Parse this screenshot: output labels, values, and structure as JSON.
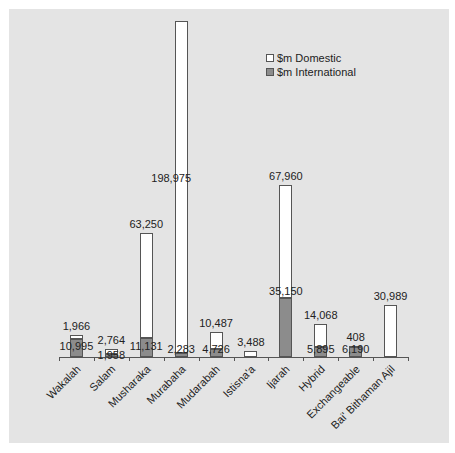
{
  "chart_data": {
    "type": "bar",
    "stacked": true,
    "title": "",
    "xlabel": "",
    "ylabel": "",
    "grid": false,
    "legend_position": "upper right",
    "categories": [
      "Wakalah",
      "Salam",
      "Musharaka",
      "Murabaha",
      "Mudarabah",
      "Istisna'a",
      "Ijarah",
      "Hybrid",
      "Exchangeable",
      "Bai' Bithaman Ajil"
    ],
    "series": [
      {
        "name": "$m International",
        "color": "#8c8c8c",
        "values": [
          10995,
          1958,
          11131,
          2283,
          4726,
          0,
          35150,
          5895,
          6190,
          0
        ]
      },
      {
        "name": "$m Domestic",
        "color": "#ffffff",
        "values": [
          1966,
          2764,
          63250,
          198975,
          10487,
          3488,
          67960,
          14068,
          408,
          30989
        ]
      }
    ],
    "labels": {
      "international": [
        "10,995",
        "1,958",
        "11,131",
        "2,283",
        "4,726",
        "",
        "35,150",
        "5,895",
        "6,190",
        ""
      ],
      "domestic": [
        "1,966",
        "2,764",
        "63,250",
        "198,975",
        "10,487",
        "3,488",
        "67,960",
        "14,068",
        "408",
        "30,989"
      ]
    }
  },
  "legend": {
    "domestic": "$m Domestic",
    "international": "$m International"
  },
  "colors": {
    "background": "#e4e4e4",
    "domestic": "#ffffff",
    "international": "#8c8c8c",
    "outline": "#555555"
  }
}
